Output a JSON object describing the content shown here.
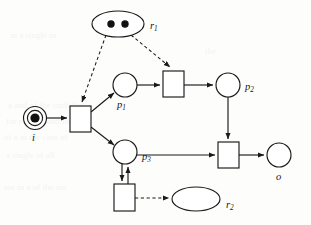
{
  "diagram": {
    "type": "petri-net",
    "canvas": {
      "width": 311,
      "height": 225
    },
    "places": [
      {
        "id": "i",
        "label": "i",
        "subscript": "",
        "shape": "double-circle",
        "cx": 35,
        "cy": 118,
        "r": 11,
        "inner_r": 7,
        "tokens": 1,
        "label_x": 32,
        "label_y": 141,
        "role": "input-place"
      },
      {
        "id": "p1",
        "label": "p",
        "subscript": "1",
        "shape": "circle",
        "cx": 125,
        "cy": 85,
        "r": 12,
        "tokens": 0,
        "label_x": 117,
        "label_y": 108,
        "role": "place"
      },
      {
        "id": "p2",
        "label": "p",
        "subscript": "2",
        "shape": "circle",
        "cx": 228,
        "cy": 85,
        "r": 12,
        "tokens": 0,
        "label_x": 245,
        "label_y": 90,
        "role": "place"
      },
      {
        "id": "p3",
        "label": "p",
        "subscript": "3",
        "shape": "circle",
        "cx": 125,
        "cy": 152,
        "r": 12,
        "tokens": 0,
        "label_x": 142,
        "label_y": 160,
        "role": "place"
      },
      {
        "id": "o",
        "label": "o",
        "subscript": "",
        "shape": "circle",
        "cx": 279,
        "cy": 155,
        "r": 12,
        "tokens": 0,
        "label_x": 276,
        "label_y": 180,
        "role": "output-place"
      }
    ],
    "resources": [
      {
        "id": "r1",
        "label": "r",
        "subscript": "1",
        "shape": "ellipse",
        "cx": 118,
        "cy": 24,
        "rx": 26,
        "ry": 13,
        "tokens": 2,
        "label_x": 150,
        "label_y": 29,
        "role": "resource-place"
      },
      {
        "id": "r2",
        "label": "r",
        "subscript": "2",
        "shape": "ellipse",
        "cx": 196,
        "cy": 199,
        "rx": 24,
        "ry": 12,
        "tokens": 0,
        "label_x": 226,
        "label_y": 208,
        "role": "resource-place"
      }
    ],
    "transitions": [
      {
        "id": "t1",
        "x": 70,
        "y": 106,
        "width": 21,
        "height": 26,
        "role": "transition"
      },
      {
        "id": "t2",
        "x": 163,
        "y": 71,
        "width": 21,
        "height": 26,
        "role": "transition"
      },
      {
        "id": "t3",
        "x": 218,
        "y": 142,
        "width": 21,
        "height": 26,
        "role": "transition"
      },
      {
        "id": "t4",
        "x": 114,
        "y": 184,
        "width": 21,
        "height": 27,
        "role": "transition"
      }
    ],
    "arcs": [
      {
        "id": "arc-i-t1",
        "from": "i",
        "to": "t1",
        "style": "solid",
        "kind": "flow"
      },
      {
        "id": "arc-t1-p1",
        "from": "t1",
        "to": "p1",
        "style": "solid",
        "kind": "flow"
      },
      {
        "id": "arc-t1-p3",
        "from": "t1",
        "to": "p3",
        "style": "solid",
        "kind": "flow"
      },
      {
        "id": "arc-p1-t2",
        "from": "p1",
        "to": "t2",
        "style": "solid",
        "kind": "flow"
      },
      {
        "id": "arc-t2-p2",
        "from": "t2",
        "to": "p2",
        "style": "solid",
        "kind": "flow"
      },
      {
        "id": "arc-p2-t3",
        "from": "p2",
        "to": "t3",
        "style": "solid",
        "kind": "flow"
      },
      {
        "id": "arc-p3-t3",
        "from": "p3",
        "to": "t3",
        "style": "solid",
        "kind": "flow"
      },
      {
        "id": "arc-t3-o",
        "from": "t3",
        "to": "o",
        "style": "solid",
        "kind": "flow"
      },
      {
        "id": "arc-p3-t4",
        "from": "p3",
        "to": "t4",
        "style": "solid",
        "kind": "flow"
      },
      {
        "id": "arc-t4-p3",
        "from": "t4",
        "to": "p3",
        "style": "solid",
        "kind": "flow"
      },
      {
        "id": "arc-r1-t1",
        "from": "r1",
        "to": "t1",
        "style": "dashed",
        "kind": "resource"
      },
      {
        "id": "arc-r1-t2",
        "from": "r1",
        "to": "t2",
        "style": "dashed",
        "kind": "resource"
      },
      {
        "id": "arc-t4-r2",
        "from": "t4",
        "to": "r2",
        "style": "dashed",
        "kind": "resource"
      }
    ]
  },
  "background_artifacts": [
    {
      "text": "in a single                      in",
      "x": 10,
      "y": 30
    },
    {
      "text": "the",
      "x": 205,
      "y": 46
    },
    {
      "text": "a    and    of   the   such   that",
      "x": 8,
      "y": 100
    },
    {
      "text": "for   each    in   and   the",
      "x": 6,
      "y": 116
    },
    {
      "text": "of    a    in   the   case   of",
      "x": 4,
      "y": 132
    },
    {
      "text": "a    single   of   all",
      "x": 6,
      "y": 150
    },
    {
      "text": "are   in   a   of   the   net",
      "x": 4,
      "y": 182
    }
  ]
}
